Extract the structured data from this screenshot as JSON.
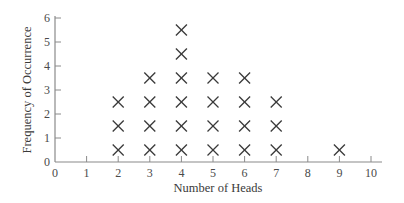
{
  "chart_data": {
    "type": "dot",
    "title": "",
    "xlabel": "Number of Heads",
    "ylabel": "Frequency of Occurrence",
    "categories": [
      0,
      1,
      2,
      3,
      4,
      5,
      6,
      7,
      8,
      9,
      10
    ],
    "values": [
      0,
      0,
      3,
      4,
      6,
      4,
      4,
      3,
      0,
      1,
      0
    ],
    "xticks": [
      "0",
      "1",
      "2",
      "3",
      "4",
      "5",
      "6",
      "7",
      "8",
      "9",
      "10"
    ],
    "yticks": [
      "0",
      "1",
      "2",
      "3",
      "4",
      "5",
      "6"
    ],
    "xlim": [
      0,
      10
    ],
    "ylim": [
      0,
      6
    ],
    "marker": "×",
    "grid": false,
    "legend": null
  },
  "colors": {
    "axis": "#8a8a8a",
    "marker": "#3a3a3a",
    "text": "#4a4a4a"
  }
}
